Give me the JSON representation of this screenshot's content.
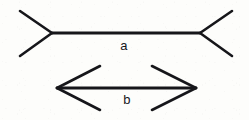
{
  "figure": {
    "name": "Muller-Lyer illusion figure",
    "background_color": "#fdfdfb",
    "line_color": "#16161a",
    "line_width": 2.6,
    "canvas": {
      "width": 249,
      "height": 120
    },
    "shafts": [
      {
        "id": "a",
        "label": "a",
        "label_x": 124,
        "label_y": 47,
        "x1": 52,
        "y1": 33,
        "x2": 200,
        "y2": 33,
        "fin_direction": "outward",
        "arrow_style": "fins-out",
        "description": "upper horizontal line with outward-splayed fins at both ends"
      },
      {
        "id": "b",
        "label": "b",
        "label_x": 127,
        "label_y": 101,
        "x1": 57,
        "y1": 88,
        "x2": 196,
        "y2": 88,
        "fin_direction": "inward",
        "arrow_style": "fins-in",
        "description": "lower horizontal line with inward double-headed arrowheads"
      }
    ],
    "fins": {
      "top_left_upper": {
        "x1": 20,
        "y1": 11,
        "x2": 52,
        "y2": 33
      },
      "top_left_lower": {
        "x1": 20,
        "y1": 56,
        "x2": 52,
        "y2": 33
      },
      "top_right_upper": {
        "x1": 232,
        "y1": 11,
        "x2": 200,
        "y2": 33
      },
      "top_right_lower": {
        "x1": 232,
        "y1": 56,
        "x2": 200,
        "y2": 33
      },
      "bottom_left_upper": {
        "x1": 100,
        "y1": 66,
        "x2": 57,
        "y2": 88
      },
      "bottom_left_lower": {
        "x1": 100,
        "y1": 110,
        "x2": 57,
        "y2": 88
      },
      "bottom_right_upper": {
        "x1": 152,
        "y1": 66,
        "x2": 196,
        "y2": 88
      },
      "bottom_right_lower": {
        "x1": 152,
        "y1": 110,
        "x2": 196,
        "y2": 88
      }
    }
  }
}
